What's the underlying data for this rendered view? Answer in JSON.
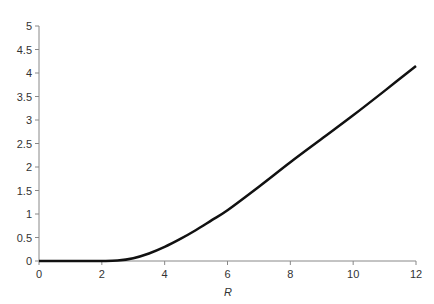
{
  "chart_data": {
    "type": "line",
    "title": "",
    "xlabel": "R",
    "ylabel": "",
    "xlim": [
      0,
      12
    ],
    "ylim": [
      0,
      5
    ],
    "grid": false,
    "legend": null,
    "x_ticks": [
      0,
      2,
      4,
      6,
      8,
      10,
      12
    ],
    "x_tick_labels": [
      "0",
      "2",
      "4",
      "6",
      "8",
      "10",
      "12"
    ],
    "y_ticks": [
      0,
      0.5,
      1,
      1.5,
      2,
      2.5,
      3,
      3.5,
      4,
      4.5,
      5
    ],
    "y_tick_labels": [
      "0",
      "0.5",
      "1",
      "1.5",
      "2",
      "2.5",
      "3",
      "3.5",
      "4",
      "4.5",
      "5"
    ],
    "series": [
      {
        "name": "curve",
        "color": "#111111",
        "x": [
          0,
          1,
          2,
          2.5,
          3,
          3.5,
          4,
          4.5,
          5,
          5.5,
          6,
          7,
          8,
          9,
          10,
          11,
          12
        ],
        "y": [
          0,
          0,
          0,
          0.01,
          0.06,
          0.16,
          0.3,
          0.47,
          0.66,
          0.87,
          1.08,
          1.58,
          2.1,
          2.6,
          3.1,
          3.62,
          4.15
        ]
      }
    ]
  }
}
